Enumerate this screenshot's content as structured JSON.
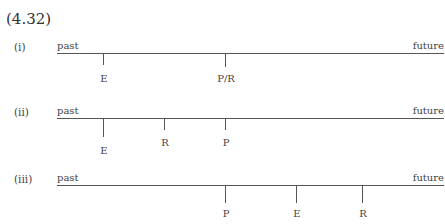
{
  "equation_number": "(4.32)",
  "diagrams": [
    {
      "label": "(i)",
      "left_label": "past",
      "right_label": "future",
      "points": [
        {
          "label": "E",
          "x": 103
        },
        {
          "label": "P/R",
          "x": 225
        }
      ]
    },
    {
      "label": "(ii)",
      "left_label": "past",
      "right_label": "future",
      "points": [
        {
          "label": "E",
          "x": 103
        },
        {
          "label": "R",
          "x": 164
        },
        {
          "label": "P",
          "x": 225
        }
      ]
    },
    {
      "label": "(iii)",
      "left_label": "past",
      "right_label": "future",
      "points": [
        {
          "label": "P",
          "x": 225
        },
        {
          "label": "E",
          "x": 296
        },
        {
          "label": "R",
          "x": 362
        }
      ]
    }
  ]
}
